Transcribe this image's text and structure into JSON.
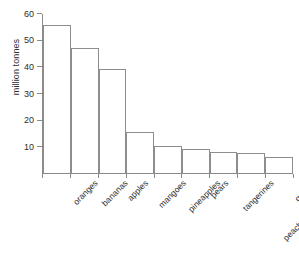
{
  "chart_data": {
    "type": "bar",
    "title": "",
    "xlabel": "",
    "ylabel": "million tonnes",
    "ylim": [
      0,
      60
    ],
    "yticks": [
      0,
      10,
      20,
      30,
      40,
      50,
      60
    ],
    "ytick_labels": [
      "",
      "10",
      "20",
      "30",
      "40",
      "50",
      "60"
    ],
    "grid": false,
    "legend": "none",
    "categories": [
      "oranges",
      "bananas",
      "apples",
      "mangoes",
      "pineapples",
      "pears",
      "tangerines",
      "peaches & nectarines",
      "grapes"
    ],
    "values": [
      55.5,
      47,
      39,
      15.5,
      10,
      9,
      8,
      7.5,
      6
    ],
    "units": "million tonnes",
    "bar_fill_color": "#ffffff",
    "bar_edge_color": "#8d8d8d",
    "axis_color": "#8a8a8a",
    "text_color": "#2e2e2e",
    "background_color": "#ffffff"
  }
}
